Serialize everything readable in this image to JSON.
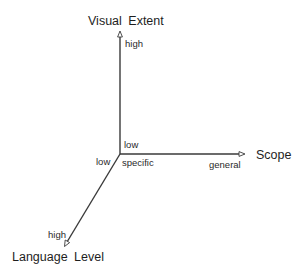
{
  "diagram": {
    "type": "3d-axes",
    "axes": {
      "vertical": {
        "title": "Visual Extent",
        "low_label": "low",
        "high_label": "high"
      },
      "horizontal": {
        "title": "Scope",
        "low_label": "specific",
        "high_label": "general"
      },
      "diagonal": {
        "title": "Language Level",
        "low_label": "low",
        "high_label": "high"
      }
    },
    "colors": {
      "axis_line": "#3a3a3a",
      "text": "#222222",
      "background": "#ffffff"
    }
  }
}
